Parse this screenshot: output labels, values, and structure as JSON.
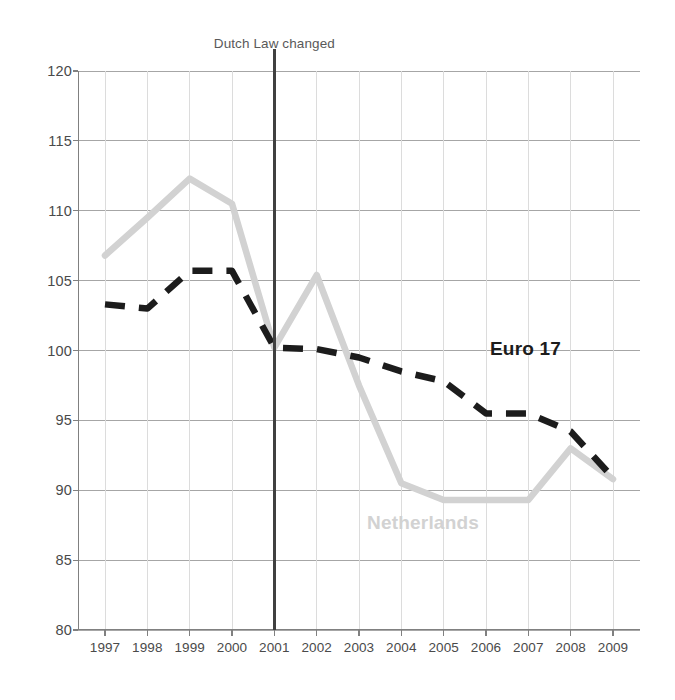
{
  "annotation": {
    "text": "Dutch Law changed",
    "at_x": 2001,
    "color": "#404040"
  },
  "labels": {
    "euro17": "Euro 17",
    "netherlands": "Netherlands"
  },
  "colors": {
    "netherlands": "#d2d2d2",
    "euro17": "#1c1c1c",
    "grid": "#a6a6a6",
    "axis": "#808080",
    "tick_text": "#4a4a4a",
    "annotation_text": "#595959"
  },
  "chart_data": {
    "type": "line",
    "title": "Dutch Law changed",
    "xlabel": "",
    "ylabel": "",
    "x": [
      1997,
      1998,
      1999,
      2000,
      2001,
      2002,
      2003,
      2004,
      2005,
      2006,
      2007,
      2008,
      2009
    ],
    "xtick_labels": [
      "1997",
      "1998",
      "1999",
      "2000",
      "2001",
      "2002",
      "2003",
      "2004",
      "2005",
      "2006",
      "2007",
      "2008",
      "2009"
    ],
    "ytick_labels": [
      "120",
      "115",
      "110",
      "105",
      "100",
      "95",
      "90",
      "85",
      "80"
    ],
    "yticks": [
      120,
      115,
      110,
      105,
      100,
      95,
      90,
      85,
      80
    ],
    "ylim": [
      80,
      120
    ],
    "xlim": [
      1997,
      2009
    ],
    "grid": true,
    "legend": "in-plot annotations",
    "annotations": [
      {
        "text": "Dutch Law changed",
        "type": "vertical-line",
        "x": 2001
      },
      {
        "text": "Euro 17",
        "type": "series-label",
        "x": 2006.1,
        "y": 100.3
      },
      {
        "text": "Netherlands",
        "type": "series-label",
        "x": 2003.5,
        "y": 87.5
      }
    ],
    "series": [
      {
        "name": "Netherlands",
        "style": "solid",
        "color": "#d2d2d2",
        "values": [
          106.8,
          109.5,
          112.3,
          110.5,
          100.2,
          105.4,
          97.5,
          90.5,
          89.3,
          89.3,
          89.3,
          93.0,
          90.8
        ]
      },
      {
        "name": "Euro 17",
        "style": "dashed",
        "color": "#1c1c1c",
        "values": [
          103.3,
          103.0,
          105.7,
          105.7,
          100.2,
          100.1,
          99.5,
          98.5,
          97.8,
          95.5,
          95.5,
          94.2,
          90.9
        ]
      }
    ]
  }
}
